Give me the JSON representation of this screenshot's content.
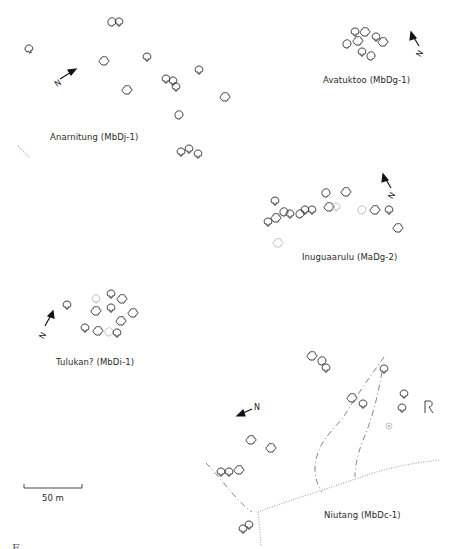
{
  "figure": {
    "sites": [
      {
        "id": "anarnitung",
        "label": "Anarnitung (MbDj-1)"
      },
      {
        "id": "avatuktoo",
        "label": "Avatuktoo (MbDg-1)"
      },
      {
        "id": "inuguaarulu",
        "label": "Inuguaarulu (MaDg-2)"
      },
      {
        "id": "tulukan",
        "label": "Tulukan? (MbDi-1)"
      },
      {
        "id": "niutang",
        "label": "Niutang (MbDc-1)"
      }
    ],
    "north_arrow_label": "N",
    "scale_bar": {
      "label": "50 m"
    },
    "caption_partial": "F . . . . . . . . . . . . . . . . . . . . . . . . . . . . . ."
  }
}
